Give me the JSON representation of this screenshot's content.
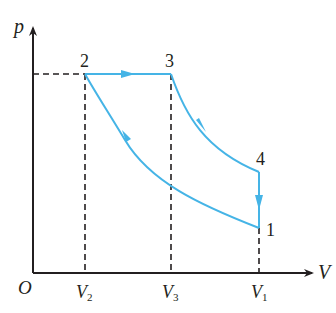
{
  "diagram": {
    "type": "p-V cycle diagram (Diesel cycle)",
    "axes": {
      "y_label": "p",
      "x_label": "V",
      "origin_label": "O",
      "x_ticks": [
        {
          "label": "V",
          "sub": "2"
        },
        {
          "label": "V",
          "sub": "3"
        },
        {
          "label": "V",
          "sub": "1"
        }
      ]
    },
    "points": [
      {
        "id": "1",
        "label": "1"
      },
      {
        "id": "2",
        "label": "2"
      },
      {
        "id": "3",
        "label": "3"
      },
      {
        "id": "4",
        "label": "4"
      }
    ],
    "processes": [
      {
        "from": "1",
        "to": "2",
        "kind": "adiabatic compression"
      },
      {
        "from": "2",
        "to": "3",
        "kind": "isobaric expansion"
      },
      {
        "from": "3",
        "to": "4",
        "kind": "adiabatic expansion"
      },
      {
        "from": "4",
        "to": "1",
        "kind": "isochoric pressure drop"
      }
    ],
    "colors": {
      "cycle": "#45b4e6",
      "axes": "#231f20",
      "dashed": "#231f20"
    }
  }
}
